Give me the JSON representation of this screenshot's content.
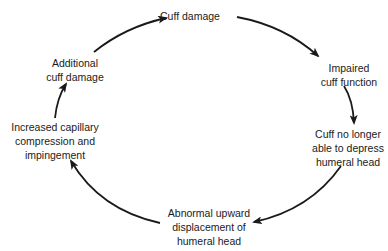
{
  "diagram": {
    "type": "cycle",
    "nodes": [
      {
        "id": "cuff-damage",
        "lines": [
          "Cuff damage"
        ]
      },
      {
        "id": "impaired-cuff-function",
        "lines": [
          "Impaired",
          "cuff function"
        ]
      },
      {
        "id": "cuff-no-longer-able",
        "lines": [
          "Cuff no longer",
          "able to depress",
          "humeral head"
        ]
      },
      {
        "id": "abnormal-upward-displacement",
        "lines": [
          "Abnormal upward",
          "displacement of",
          "humeral head"
        ]
      },
      {
        "id": "increased-capillary-compression",
        "lines": [
          "Increased capillary",
          "compression and",
          "impingement"
        ]
      },
      {
        "id": "additional-cuff-damage",
        "lines": [
          "Additional",
          "cuff damage"
        ]
      }
    ],
    "edges": [
      {
        "from": "cuff-damage",
        "to": "impaired-cuff-function"
      },
      {
        "from": "impaired-cuff-function",
        "to": "cuff-no-longer-able"
      },
      {
        "from": "cuff-no-longer-able",
        "to": "abnormal-upward-displacement"
      },
      {
        "from": "abnormal-upward-displacement",
        "to": "increased-capillary-compression"
      },
      {
        "from": "increased-capillary-compression",
        "to": "additional-cuff-damage"
      },
      {
        "from": "additional-cuff-damage",
        "to": "cuff-damage"
      }
    ],
    "colors": {
      "line": "#1a1a1a",
      "background": "#ffffff"
    }
  }
}
